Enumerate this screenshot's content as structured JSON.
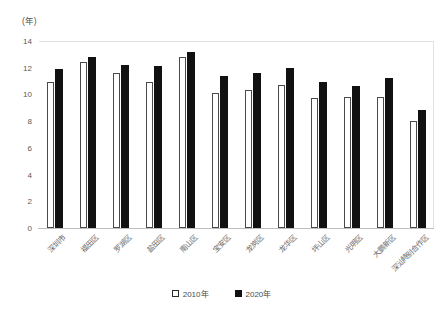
{
  "chart_data": {
    "type": "bar",
    "title": "",
    "subtitle": "",
    "xlabel": "",
    "ylabel": "",
    "y_unit_label": "(年)",
    "ylim": [
      0,
      14
    ],
    "yticks": [
      0,
      2,
      4,
      6,
      8,
      10,
      12,
      14
    ],
    "grid": false,
    "legend_position": "bottom-center",
    "categories": [
      "深圳市",
      "福田区",
      "罗湖区",
      "盐田区",
      "南山区",
      "宝安区",
      "龙岗区",
      "龙华区",
      "坪山区",
      "光明区",
      "大鹏新区",
      "深汕特别合作区"
    ],
    "series": [
      {
        "name": "2010年",
        "color": "#ffffff",
        "edge_color": "#4a4a4a",
        "values": [
          10.9,
          12.4,
          11.6,
          10.9,
          12.8,
          10.1,
          10.3,
          10.7,
          9.7,
          9.8,
          9.8,
          8.0
        ]
      },
      {
        "name": "2020年",
        "color": "#111111",
        "edge_color": "#111111",
        "values": [
          11.9,
          12.8,
          12.2,
          12.1,
          13.2,
          11.4,
          11.6,
          12.0,
          10.9,
          10.6,
          11.2,
          8.8
        ]
      }
    ]
  },
  "legend": {
    "items": [
      {
        "label": "2010年",
        "style": "hollow"
      },
      {
        "label": "2020年",
        "style": "solid"
      }
    ]
  }
}
